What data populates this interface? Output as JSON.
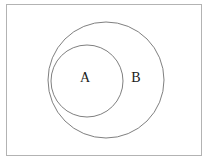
{
  "figure": {
    "name": "venn-diagram",
    "width": 209,
    "height": 163,
    "background_color": "#ffffff",
    "universe": {
      "label": "",
      "shape": "rectangle",
      "x": 6,
      "y": 4,
      "width": 195,
      "height": 151,
      "stroke_color": "#b3b3b3",
      "stroke_width": 1,
      "fill": "none"
    },
    "sets": [
      {
        "label": "B",
        "shape": "circle",
        "cx": 106,
        "cy": 80,
        "r": 58,
        "stroke_color": "#808080",
        "stroke_width": 1,
        "fill": "none",
        "label_x": 136,
        "label_y": 79
      },
      {
        "label": "A",
        "shape": "circle",
        "cx": 87,
        "cy": 81,
        "r": 36,
        "stroke_color": "#808080",
        "stroke_width": 1,
        "fill": "none",
        "label_x": 85,
        "label_y": 79
      }
    ],
    "relation": "A is a subset of B"
  }
}
